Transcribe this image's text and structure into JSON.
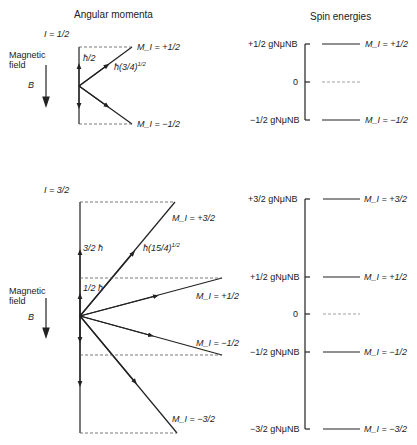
{
  "headings": {
    "left": "Angular momenta",
    "right": "Spin energies"
  },
  "top": {
    "spin_label": "I = 1/2",
    "field_label_1": "Magnetic",
    "field_label_2": "field",
    "field_symbol": "B",
    "component_label": "ħ/2",
    "magnitude_label": "ħ(3/4)",
    "magnitude_exp": "1/2",
    "states": [
      "M_I = +1/2",
      "M_I = −1/2"
    ],
    "energy_labels": [
      "+1/2 gNμNB",
      "0",
      "−1/2 gNμNB"
    ]
  },
  "bottom": {
    "spin_label": "I = 3/2",
    "field_label_1": "Magnetic",
    "field_label_2": "field",
    "field_symbol": "B",
    "component_labels": [
      "3/2 ħ",
      "1/2 ħ"
    ],
    "magnitude_label": "ħ(15/4)",
    "magnitude_exp": "1/2",
    "states": [
      "M_I = +3/2",
      "M_I = +1/2",
      "M_I = −1/2",
      "M_I = −3/2"
    ],
    "energy_labels": [
      "+3/2 gNμNB",
      "+1/2 gNμNB",
      "0",
      "−1/2 gNμNB",
      "−3/2 gNμNB"
    ]
  }
}
